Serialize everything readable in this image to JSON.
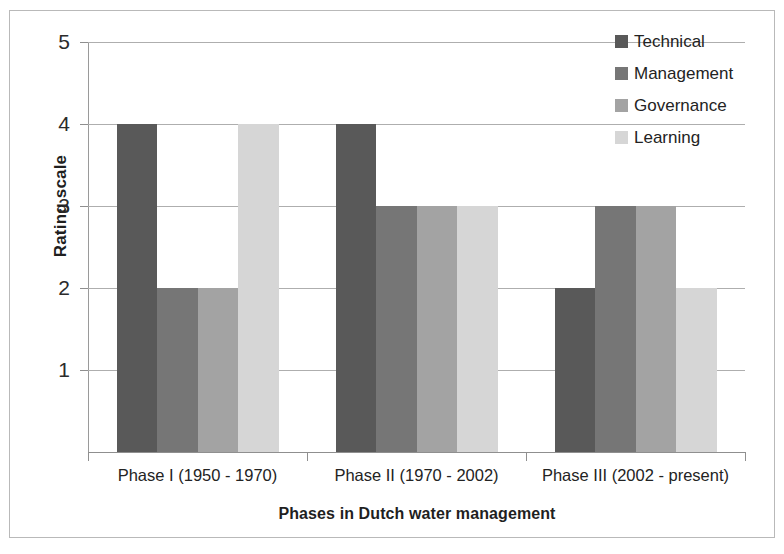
{
  "chart_data": {
    "type": "bar",
    "title": "",
    "subtitle": "",
    "xlabel": "Phases in Dutch water management",
    "ylabel": "Rating scale",
    "categories": [
      "Phase I (1950 - 1970)",
      "Phase II (1970 - 2002)",
      "Phase III (2002 - present)"
    ],
    "series": [
      {
        "name": "Technical",
        "color": "#595959",
        "values": [
          4,
          4,
          2
        ]
      },
      {
        "name": "Management",
        "color": "#767676",
        "values": [
          2,
          3,
          3
        ]
      },
      {
        "name": "Governance",
        "color": "#a3a3a3",
        "values": [
          2,
          3,
          3
        ]
      },
      {
        "name": "Learning",
        "color": "#d6d6d6",
        "values": [
          4,
          3,
          2
        ]
      }
    ],
    "ylim": [
      0,
      5
    ],
    "yticks": [
      1,
      2,
      3,
      4,
      5
    ],
    "ytick_labels": [
      "1",
      "2",
      "3",
      "4",
      "5"
    ],
    "grid": true,
    "grid_axis": "y",
    "legend_position": "top-right",
    "bar_gap": 0,
    "background": "#ffffff",
    "axis_color": "#8f8f8f",
    "grid_color": "#aeaeae",
    "text_color": "#232323"
  }
}
